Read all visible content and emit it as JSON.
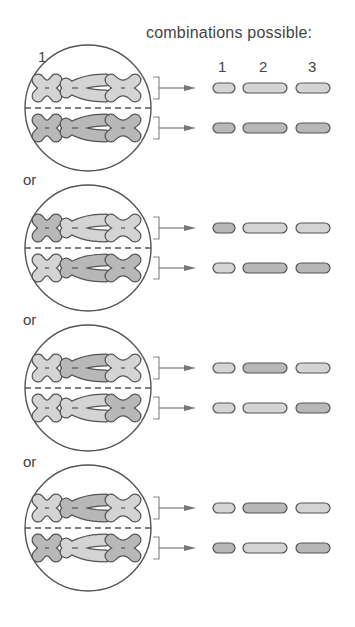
{
  "title": "combinations possible:",
  "separator_label": "or",
  "chromosome_numbers": [
    "1",
    "2",
    "3"
  ],
  "colors": {
    "outline": "#555555",
    "chromosome_light": "#d4d4d4",
    "chromosome_dark": "#b8b8b8",
    "arrow": "#777777"
  },
  "scenarios": [
    {
      "id": 1,
      "circle_center_y": 108,
      "show_numbers": true,
      "top_row": [
        "light",
        "light",
        "light"
      ],
      "bottom_row": [
        "dark",
        "dark",
        "dark"
      ]
    },
    {
      "id": 2,
      "circle_center_y": 248,
      "show_numbers": false,
      "top_row": [
        "dark",
        "light",
        "light"
      ],
      "bottom_row": [
        "light",
        "dark",
        "dark"
      ]
    },
    {
      "id": 3,
      "circle_center_y": 388,
      "show_numbers": false,
      "top_row": [
        "light",
        "dark",
        "light"
      ],
      "bottom_row": [
        "light",
        "light",
        "dark"
      ]
    },
    {
      "id": 4,
      "circle_center_y": 528,
      "show_numbers": false,
      "top_row": [
        "light",
        "dark",
        "light"
      ],
      "bottom_row": [
        "dark",
        "light",
        "dark"
      ]
    }
  ],
  "or_positions_y": [
    171,
    311,
    453
  ]
}
